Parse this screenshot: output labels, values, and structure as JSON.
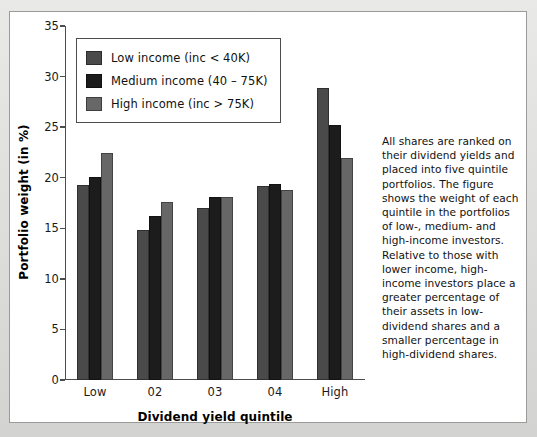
{
  "chart_data": {
    "type": "bar",
    "title": "",
    "xlabel": "Dividend yield quintile",
    "ylabel": "Portfolio weight (in %)",
    "categories": [
      "Low",
      "02",
      "03",
      "04",
      "High"
    ],
    "ylim": [
      0,
      35
    ],
    "yticks": [
      0,
      5,
      10,
      15,
      20,
      25,
      30,
      35
    ],
    "grid": false,
    "legend_position": "upper-left",
    "series": [
      {
        "name": "Low income (inc < 40K)",
        "color": "#4a4a4a",
        "values": [
          19.3,
          14.8,
          17.0,
          19.2,
          28.9
        ]
      },
      {
        "name": "Medium income (40 – 75K)",
        "color": "#1c1c1c",
        "values": [
          20.1,
          16.2,
          18.1,
          19.4,
          25.2
        ]
      },
      {
        "name": "High income (inc > 75K)",
        "color": "#676767",
        "values": [
          22.4,
          17.6,
          18.1,
          18.8,
          22.0
        ]
      }
    ]
  },
  "caption": {
    "text": "All shares are ranked on their dividend yields and placed into five quintile portfolios. The figure shows the weight of each quintile in the portfolios of low-, medium- and high-income investors. Relative to those with lower income, high-income investors place a greater percentage of their assets in low-dividend shares and a smaller percentage in high-dividend shares."
  }
}
